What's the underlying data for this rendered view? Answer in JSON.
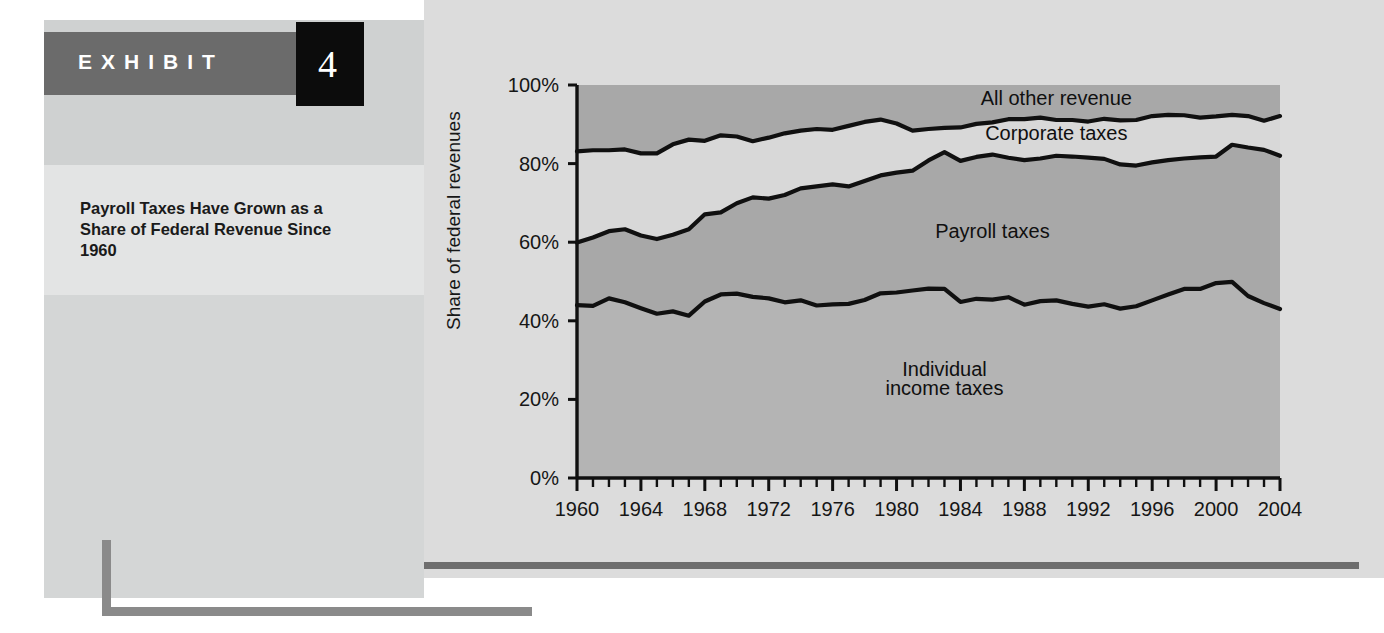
{
  "exhibit": {
    "word": "EXHIBIT",
    "number": "4",
    "title": "Payroll Taxes Have Grown as a Share of Federal Revenue Since 1960"
  },
  "colors": {
    "band_dark": "#a8a8a8",
    "band_mid": "#d8d8d8",
    "band_light": "#b4b4b4",
    "line": "#101010",
    "header_gray": "#6b6b6b",
    "header_black": "#0c0c0c",
    "rule_gray": "#6e6e6e"
  },
  "chart_data": {
    "type": "area",
    "title": "",
    "subtitle": "",
    "xlabel": "",
    "ylabel": "Share of federal revenues",
    "xlim": [
      1960,
      2004
    ],
    "ylim": [
      0,
      100
    ],
    "grid": false,
    "legend_position": "inline-annotations",
    "ytick_labels": [
      "0%",
      "20%",
      "40%",
      "60%",
      "80%",
      "100%"
    ],
    "ytick_values": [
      0,
      20,
      40,
      60,
      80,
      100
    ],
    "xtick_labels": [
      "1960",
      "1964",
      "1968",
      "1972",
      "1976",
      "1980",
      "1984",
      "1988",
      "1992",
      "1996",
      "2000",
      "2004"
    ],
    "xtick_values": [
      1960,
      1964,
      1968,
      1972,
      1976,
      1980,
      1984,
      1988,
      1992,
      1996,
      2000,
      2004
    ],
    "minor_tick_interval": 1,
    "annotations": [
      {
        "text": "All other revenue",
        "x": 1990,
        "y": 95
      },
      {
        "text": "Corporate taxes",
        "x": 1990,
        "y": 86
      },
      {
        "text": "Payroll taxes",
        "x": 1986,
        "y": 61
      },
      {
        "text": "Individual",
        "x": 1983,
        "y": 26
      },
      {
        "text": "income taxes",
        "x": 1983,
        "y": 21
      }
    ],
    "x": [
      1960,
      1961,
      1962,
      1963,
      1964,
      1965,
      1966,
      1967,
      1968,
      1969,
      1970,
      1971,
      1972,
      1973,
      1974,
      1975,
      1976,
      1977,
      1978,
      1979,
      1980,
      1981,
      1982,
      1983,
      1984,
      1985,
      1986,
      1987,
      1988,
      1989,
      1990,
      1991,
      1992,
      1993,
      1994,
      1995,
      1996,
      1997,
      1998,
      1999,
      2000,
      2001,
      2002,
      2003,
      2004
    ],
    "series": [
      {
        "name": "Individual income taxes",
        "values": [
          44.0,
          43.8,
          45.7,
          44.7,
          43.2,
          41.8,
          42.4,
          41.3,
          44.9,
          46.7,
          46.9,
          46.1,
          45.7,
          44.7,
          45.2,
          43.9,
          44.2,
          44.3,
          45.3,
          47.0,
          47.2,
          47.7,
          48.2,
          48.1,
          44.8,
          45.6,
          45.4,
          46.0,
          44.1,
          45.0,
          45.2,
          44.3,
          43.6,
          44.2,
          43.1,
          43.7,
          45.2,
          46.7,
          48.1,
          48.1,
          49.6,
          49.9,
          46.3,
          44.5,
          43.0
        ]
      },
      {
        "name": "Payroll taxes",
        "values": [
          15.9,
          17.4,
          17.1,
          18.6,
          18.5,
          19.0,
          19.5,
          22.0,
          22.2,
          20.9,
          23.0,
          25.3,
          25.4,
          27.3,
          28.5,
          30.3,
          30.5,
          29.9,
          30.3,
          30.0,
          30.5,
          30.5,
          32.6,
          34.8,
          35.9,
          36.1,
          36.9,
          35.5,
          36.8,
          36.3,
          36.8,
          37.5,
          37.9,
          37.0,
          36.7,
          35.8,
          35.1,
          34.2,
          33.2,
          33.5,
          32.2,
          34.9,
          37.8,
          39.0,
          39.0
        ]
      },
      {
        "name": "Corporate taxes",
        "values": [
          23.2,
          22.2,
          20.6,
          20.3,
          20.9,
          21.8,
          23.0,
          22.8,
          18.7,
          19.6,
          17.0,
          14.3,
          15.5,
          15.7,
          14.7,
          14.6,
          13.9,
          15.4,
          15.0,
          14.2,
          12.5,
          10.2,
          8.0,
          6.2,
          8.5,
          8.4,
          8.2,
          9.8,
          10.4,
          10.4,
          9.1,
          9.3,
          9.2,
          10.2,
          11.2,
          11.6,
          11.8,
          11.5,
          11.0,
          10.1,
          10.2,
          7.6,
          8.0,
          7.4,
          10.1
        ]
      },
      {
        "name": "All other revenue",
        "values": [
          16.9,
          16.6,
          16.6,
          16.4,
          17.4,
          17.4,
          15.1,
          13.9,
          14.2,
          12.8,
          13.1,
          14.3,
          13.4,
          12.3,
          11.6,
          11.2,
          11.4,
          10.4,
          9.4,
          8.8,
          9.8,
          11.6,
          11.2,
          10.9,
          10.8,
          9.9,
          9.5,
          8.7,
          8.7,
          8.3,
          8.9,
          8.9,
          9.3,
          8.6,
          9.0,
          8.9,
          7.9,
          7.6,
          7.7,
          8.3,
          8.0,
          7.6,
          7.9,
          9.1,
          7.9
        ]
      }
    ],
    "cumulative_boundaries": {
      "note": "stacked upper edges, bottom-to-top",
      "individual_top": [
        44.0,
        43.8,
        45.7,
        44.7,
        43.2,
        41.8,
        42.4,
        41.3,
        44.9,
        46.7,
        46.9,
        46.1,
        45.7,
        44.7,
        45.2,
        43.9,
        44.2,
        44.3,
        45.3,
        47.0,
        47.2,
        47.7,
        48.2,
        48.1,
        44.8,
        45.6,
        45.4,
        46.0,
        44.1,
        45.0,
        45.2,
        44.3,
        43.6,
        44.2,
        43.1,
        43.7,
        45.2,
        46.7,
        48.1,
        48.1,
        49.6,
        49.9,
        46.3,
        44.5,
        43.0
      ],
      "payroll_top": [
        59.9,
        61.2,
        62.8,
        63.3,
        61.7,
        60.8,
        61.9,
        63.3,
        67.1,
        67.6,
        69.9,
        71.4,
        71.1,
        72.0,
        73.7,
        74.2,
        74.7,
        74.2,
        75.6,
        77.0,
        77.7,
        78.2,
        80.8,
        82.9,
        80.7,
        81.7,
        82.3,
        81.5,
        80.9,
        81.3,
        82.0,
        81.8,
        81.5,
        81.2,
        79.8,
        79.5,
        80.3,
        80.9,
        81.3,
        81.6,
        81.8,
        84.8,
        84.1,
        83.5,
        82.0
      ],
      "corporate_top": [
        83.1,
        83.4,
        83.4,
        83.6,
        82.6,
        82.6,
        84.9,
        86.1,
        85.8,
        87.2,
        86.9,
        85.7,
        86.6,
        87.7,
        88.4,
        88.8,
        88.6,
        89.6,
        90.6,
        91.2,
        90.2,
        88.4,
        88.8,
        89.1,
        89.2,
        90.1,
        90.5,
        91.3,
        91.3,
        91.7,
        91.1,
        91.1,
        90.7,
        91.4,
        91.0,
        91.1,
        92.1,
        92.4,
        92.3,
        91.7,
        92.0,
        92.4,
        92.1,
        90.9,
        92.1
      ]
    }
  }
}
